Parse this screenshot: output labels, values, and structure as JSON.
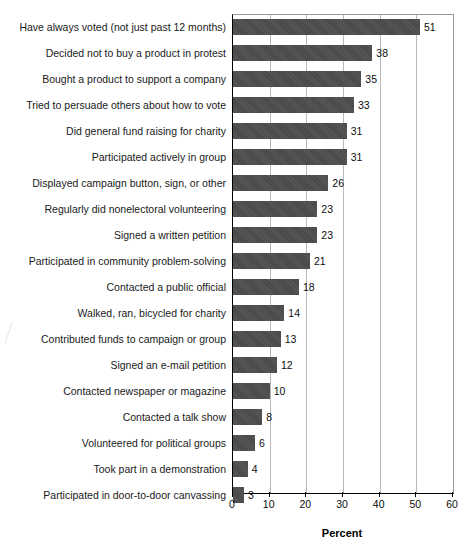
{
  "chart_data": {
    "type": "bar",
    "orientation": "horizontal",
    "title": "",
    "xlabel": "Percent",
    "ylabel": "",
    "xlim": [
      0,
      60
    ],
    "xticks": [
      0,
      10,
      20,
      30,
      40,
      50,
      60
    ],
    "grid": true,
    "legend": null,
    "bar_color": "#4b4b4b",
    "categories": [
      "Have always voted (not just past 12 months)",
      "Decided not to buy a product in protest",
      "Bought a product to support a company",
      "Tried to persuade others about how to vote",
      "Did general fund raising for charity",
      "Participated actively in group",
      "Displayed campaign button, sign, or other",
      "Regularly did nonelectoral volunteering",
      "Signed a written petition",
      "Participated in community problem-solving",
      "Contacted a public official",
      "Walked, ran, bicycled for charity",
      "Contributed funds to campaign or group",
      "Signed an e-mail petition",
      "Contacted newspaper or magazine",
      "Contacted a talk show",
      "Volunteered for political groups",
      "Took part in a demonstration",
      "Participated in door-to-door canvassing"
    ],
    "values": [
      51,
      38,
      35,
      33,
      31,
      31,
      26,
      23,
      23,
      21,
      18,
      14,
      13,
      12,
      10,
      8,
      6,
      4,
      3
    ],
    "value_labels": [
      "51",
      "38",
      "35",
      "33",
      "31",
      "31",
      "26",
      "23",
      "23",
      "21",
      "18",
      "14",
      "13",
      "12",
      "10",
      "8",
      "6",
      "4",
      "3"
    ],
    "xtick_labels": [
      "0",
      "10",
      "20",
      "30",
      "40",
      "50",
      "60"
    ]
  }
}
